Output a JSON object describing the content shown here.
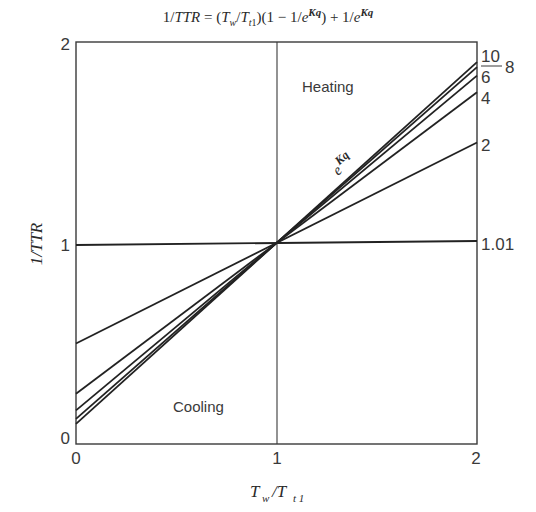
{
  "title": {
    "text": "1/TTR = (T_w/T_t1)(1 − 1/e^Kq) + 1/e^Kq"
  },
  "chart_data": {
    "type": "line",
    "xlabel": "Tw/Tt1",
    "ylabel": "1/TTR",
    "xlim": [
      0,
      2
    ],
    "ylim": [
      0,
      2
    ],
    "x_ticks": [
      "0",
      "1",
      "2"
    ],
    "y_ticks": [
      "0",
      "1",
      "2"
    ],
    "grid": false,
    "reference_lines": [
      {
        "axis": "x",
        "value": 1
      }
    ],
    "annotations": [
      {
        "text": "Heating",
        "x": 1.25,
        "y": 1.8
      },
      {
        "text": "Cooling",
        "x": 0.5,
        "y": 0.18
      },
      {
        "text": "e^Kq",
        "x": 1.3,
        "y": 1.4,
        "rotated": true
      }
    ],
    "legend_position": "right edge labels",
    "series": [
      {
        "name": "10",
        "x": [
          0,
          2
        ],
        "values": [
          0.1,
          1.9
        ]
      },
      {
        "name": "8",
        "x": [
          0,
          2
        ],
        "values": [
          0.125,
          1.875
        ]
      },
      {
        "name": "6",
        "x": [
          0,
          2
        ],
        "values": [
          0.167,
          1.833
        ]
      },
      {
        "name": "4",
        "x": [
          0,
          2
        ],
        "values": [
          0.25,
          1.75
        ]
      },
      {
        "name": "2",
        "x": [
          0,
          2
        ],
        "values": [
          0.5,
          1.5
        ]
      },
      {
        "name": "1.01",
        "x": [
          0,
          2
        ],
        "values": [
          0.99,
          1.01
        ]
      }
    ]
  },
  "labels": {
    "x_tick_0": "0",
    "x_tick_1": "1",
    "x_tick_2": "2",
    "y_tick_0": "0",
    "y_tick_1": "1",
    "y_tick_2": "2",
    "heating": "Heating",
    "cooling": "Cooling",
    "ekq_base": "e",
    "ekq_exp": "Kq",
    "series_10": "10",
    "series_8": "8",
    "series_6": "6",
    "series_4": "4",
    "series_2": "2",
    "series_101": "1.01",
    "ylabel": "1/TTR",
    "xlabel_T1": "T",
    "xlabel_w": "w",
    "xlabel_slash": "/T",
    "xlabel_t1": "t 1"
  }
}
